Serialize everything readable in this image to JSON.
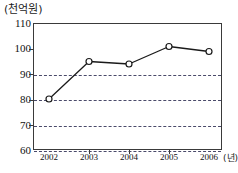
{
  "chart_data": {
    "type": "line",
    "title": "",
    "y_unit_caption": "(천억원)",
    "x_unit_caption": "(년)",
    "xlabel": "",
    "ylabel": "",
    "categories": [
      "2002",
      "2003",
      "2004",
      "2005",
      "2006"
    ],
    "x_tick_labels": [
      "2002",
      "2003",
      "2004",
      "2005",
      "2006"
    ],
    "last_x_label_with_unit": "2006 (년)",
    "values": [
      80,
      95,
      94,
      101,
      99
    ],
    "series": [
      {
        "name": "금액",
        "values": [
          80,
          95,
          94,
          101,
          99
        ]
      }
    ],
    "ylim": [
      60,
      110
    ],
    "y_ticks": [
      60,
      70,
      80,
      90,
      100,
      110
    ],
    "y_tick_labels": [
      "60",
      "70",
      "80",
      "90",
      "100",
      "110"
    ],
    "grid": true,
    "gridlines_at": [
      70,
      80,
      90,
      100
    ],
    "legend": null,
    "legend_position": "none",
    "marker": "open-circle",
    "line_color": "#1a1a1a",
    "marker_fill": "#ffffff",
    "grid_color": "#4a4a6a",
    "axis_color": "#3a3a3a",
    "annotations": []
  }
}
